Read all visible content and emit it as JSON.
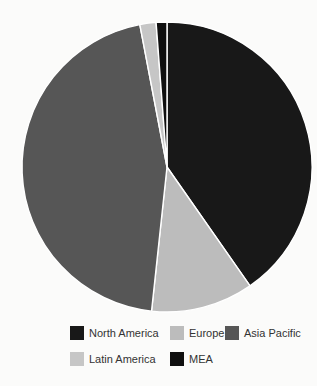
{
  "chart_data": {
    "type": "pie",
    "title": "",
    "labels": [
      "North America",
      "Europe",
      "Asia Pacific",
      "Latin America",
      "MEA"
    ],
    "values": [
      40.3,
      11.4,
      45.3,
      1.8,
      1.2
    ],
    "colors": [
      "#181818",
      "#bcbcbc",
      "#565656",
      "#c6c6c6",
      "#0f0f0f"
    ],
    "start_angle": "12-oclock",
    "direction": "clockwise",
    "slice_separator_color": "#ffffff",
    "legend_position": "bottom",
    "legend_rows": [
      [
        "North America",
        "Europe",
        "Asia Pacific"
      ],
      [
        "Latin America",
        "MEA"
      ]
    ],
    "background_color": "#fbfbfa",
    "legend_text_color": "#333333"
  }
}
